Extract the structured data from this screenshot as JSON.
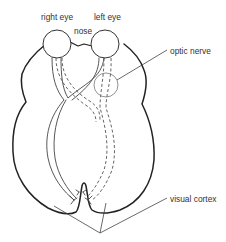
{
  "diagram": {
    "type": "anatomical-schematic",
    "labels": {
      "right_eye": "right eye",
      "left_eye": "left eye",
      "nose": "nose",
      "optic_nerve": "optic nerve",
      "visual_cortex": "visual cortex"
    },
    "elements": [
      {
        "id": "right-eye",
        "shape": "circle",
        "label_key": "right_eye"
      },
      {
        "id": "left-eye",
        "shape": "circle",
        "label_key": "left_eye"
      },
      {
        "id": "nose",
        "shape": "v-notch between eyes",
        "label_key": "nose"
      },
      {
        "id": "optic-nerve-highlight",
        "shape": "circle",
        "label_key": "optic_nerve"
      },
      {
        "id": "nerve-path-solid",
        "style": "solid double line",
        "from": "right-eye",
        "to": "left side of cortex"
      },
      {
        "id": "nerve-path-dashed",
        "style": "dashed double line",
        "from": "left-eye",
        "to": "right side of cortex"
      },
      {
        "id": "visual-cortex",
        "style": "two leader lines to both hemispheres",
        "label_key": "visual_cortex"
      }
    ],
    "colors": {
      "outline": "#222222",
      "text": "#333333",
      "background": "#ffffff"
    }
  }
}
